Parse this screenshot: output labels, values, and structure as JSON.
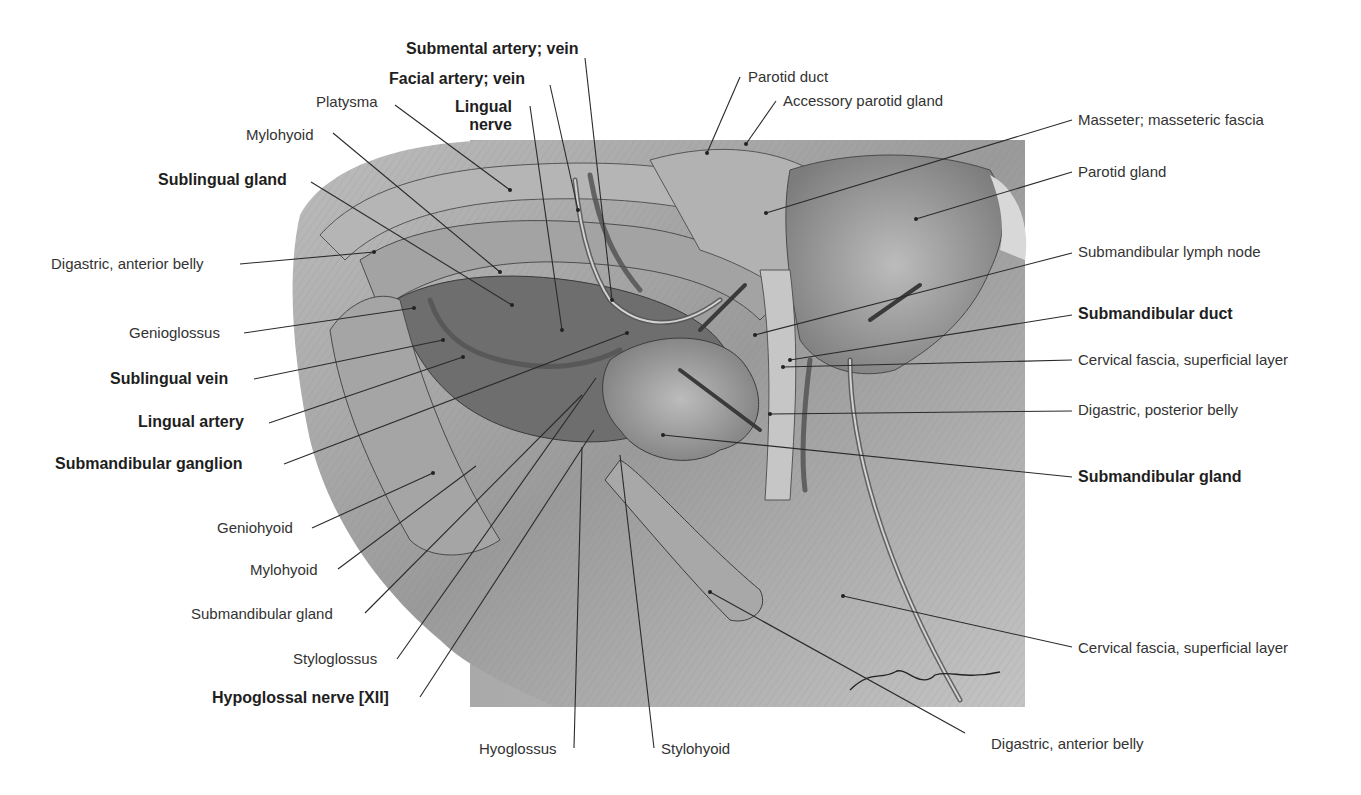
{
  "figure": {
    "type": "anatomical-illustration",
    "colors": {
      "background": "#ffffff",
      "illustration_base": "#9c9c9c",
      "illustration_light": "#d8d8d8",
      "illustration_dark": "#4a4a4a",
      "leader_line": "#2a2a2a",
      "label_text": "#333333"
    }
  },
  "labels": {
    "submental_artery_vein": "Submental artery; vein",
    "facial_artery_vein": "Facial artery; vein",
    "lingual_nerve": "Lingual\nnerve",
    "platysma": "Platysma",
    "mylohyoid_top": "Mylohyoid",
    "sublingual_gland": "Sublingual gland",
    "digastric_anterior_belly_left": "Digastric, anterior belly",
    "genioglossus": "Genioglossus",
    "sublingual_vein": "Sublingual vein",
    "lingual_artery": "Lingual artery",
    "submandibular_ganglion": "Submandibular ganglion",
    "geniohyoid": "Geniohyoid",
    "mylohyoid_bottom": "Mylohyoid",
    "submandibular_gland_left": "Submandibular gland",
    "styloglossus": "Styloglossus",
    "hypoglossal_nerve": "Hypoglossal nerve [XII]",
    "hyoglossus": "Hyoglossus",
    "stylohyoid": "Stylohyoid",
    "digastric_anterior_belly_bottom": "Digastric, anterior belly",
    "parotid_duct": "Parotid duct",
    "accessory_parotid_gland": "Accessory parotid gland",
    "masseter_fascia": "Masseter; masseteric fascia",
    "parotid_gland": "Parotid gland",
    "submandibular_lymph_node": "Submandibular lymph node",
    "submandibular_duct": "Submandibular duct",
    "cervical_fascia_top": "Cervical fascia, superficial layer",
    "digastric_posterior_belly": "Digastric, posterior belly",
    "submandibular_gland_right": "Submandibular gland",
    "cervical_fascia_bottom": "Cervical fascia, superficial layer"
  },
  "signature": "Asmussen"
}
